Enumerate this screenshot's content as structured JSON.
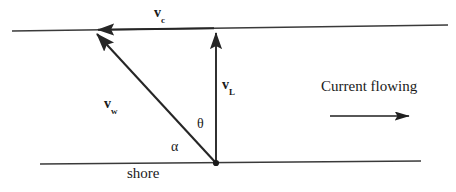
{
  "diagram": {
    "background_color": "#ffffff",
    "stroke_color": "#262626",
    "labels": {
      "vc_base": "v",
      "vc_sub": "c",
      "vw_base": "v",
      "vw_sub": "w",
      "vl_base": "v",
      "vl_sub": "L",
      "theta": "θ",
      "alpha": "α",
      "shore": "shore",
      "current_flowing": "Current flowing"
    },
    "geometry": {
      "top_bank_line": {
        "x1": 12,
        "y1": 31,
        "x2": 448,
        "y2": 25
      },
      "bottom_bank_line": {
        "x1": 40,
        "y1": 164,
        "x2": 421,
        "y2": 161
      },
      "vl_arrow": {
        "x1": 216,
        "y1": 163,
        "x2": 216,
        "y2": 29,
        "direction": "up"
      },
      "vc_arrow": {
        "x1": 214,
        "y1": 28,
        "x2": 92,
        "y2": 30,
        "direction": "left"
      },
      "vw_arrow": {
        "x1": 216,
        "y1": 163,
        "x2": 93,
        "y2": 30,
        "direction": "up-left"
      },
      "current_arrow": {
        "x1": 330,
        "y1": 116,
        "x2": 416,
        "y2": 116,
        "direction": "right"
      },
      "vertex_dot": {
        "cx": 216,
        "cy": 163,
        "r": 3
      }
    }
  }
}
